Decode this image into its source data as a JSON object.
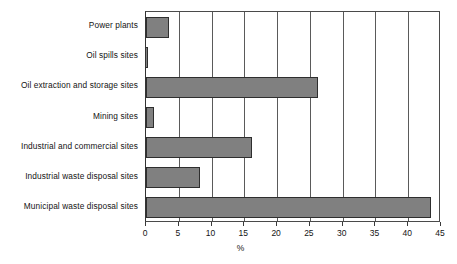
{
  "chart_data": {
    "type": "bar",
    "orientation": "horizontal",
    "title": "",
    "subtitle": "",
    "xlabel": "%",
    "ylabel": "",
    "xlim": [
      0,
      45
    ],
    "xticks": [
      0,
      5,
      10,
      15,
      20,
      25,
      30,
      35,
      40,
      45
    ],
    "xtick_labels": [
      "0",
      "5",
      "10",
      "15",
      "20",
      "25",
      "30",
      "35",
      "40",
      "45"
    ],
    "grid": true,
    "grid_axis": "x",
    "legend": false,
    "legend_position": "none",
    "bar_fill_color": "#808080",
    "bar_edge_color": "#2e2e2e",
    "axis_color": "#3a3a3a",
    "background_color": "#ffffff",
    "categories": [
      "Power plants",
      "Oil spills sites",
      "Oil extraction and storage sites",
      "Mining sites",
      "Industrial and commercial sites",
      "Industrial waste disposal sites",
      "Municipal waste disposal sites"
    ],
    "values": [
      3.5,
      0.3,
      26.2,
      1.2,
      16.1,
      8.2,
      43.5
    ],
    "series": [
      {
        "name": "Share of contaminated sites",
        "values": [
          3.5,
          0.3,
          26.2,
          1.2,
          16.1,
          8.2,
          43.5
        ]
      }
    ],
    "annotations": []
  }
}
